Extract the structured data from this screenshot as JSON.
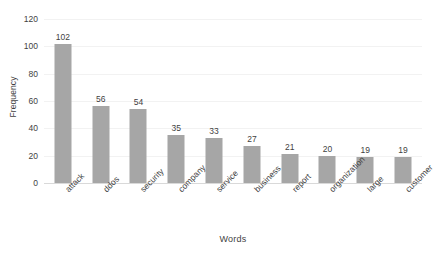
{
  "chart_data": {
    "type": "bar",
    "title": "",
    "xlabel": "Words",
    "ylabel": "Frequency",
    "categories": [
      "attack",
      "ddos",
      "security",
      "company",
      "service",
      "business",
      "report",
      "organization",
      "large",
      "customer"
    ],
    "values": [
      102,
      56,
      54,
      35,
      33,
      27,
      21,
      20,
      19,
      19
    ],
    "ylim": [
      0,
      120
    ],
    "yticks": [
      0,
      20,
      40,
      60,
      80,
      100,
      120
    ],
    "ytick_labels": [
      "0",
      "20",
      "40",
      "60",
      "80",
      "100",
      "120"
    ],
    "value_labels": [
      "102",
      "56",
      "54",
      "35",
      "33",
      "27",
      "21",
      "20",
      "19",
      "19"
    ],
    "grid": true,
    "legend": "none",
    "bar_color": "#a6a6a6",
    "grid_color": "#f2f2f2",
    "axis_color": "#d9d9d9",
    "text_color": "#3f3f3f",
    "background": "#ffffff",
    "xtick_rotation": -45
  }
}
